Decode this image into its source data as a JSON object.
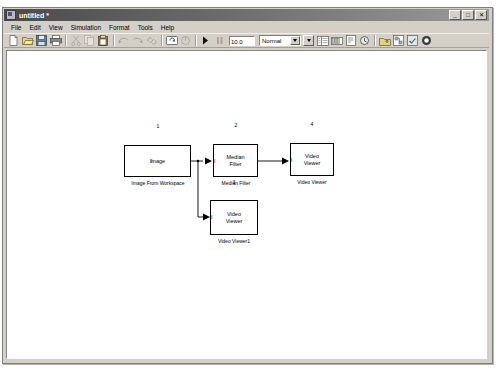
{
  "window": {
    "title": "untitled *",
    "icon": "simulink-model-icon",
    "buttons": [
      {
        "name": "minimize",
        "glyph": "_"
      },
      {
        "name": "maximize",
        "glyph": "□"
      },
      {
        "name": "close",
        "glyph": "✕"
      }
    ]
  },
  "menubar": {
    "items": [
      {
        "label": "File"
      },
      {
        "label": "Edit"
      },
      {
        "label": "View"
      },
      {
        "label": "Simulation"
      },
      {
        "label": "Format"
      },
      {
        "label": "Tools"
      },
      {
        "label": "Help"
      }
    ]
  },
  "toolbar": {
    "stop_time": "10.0",
    "sim_mode": "Normal",
    "buttons": [
      {
        "name": "new-model-icon"
      },
      {
        "name": "open-folder-icon"
      },
      {
        "name": "save-icon"
      },
      {
        "name": "print-icon"
      },
      {
        "name": "cut-icon"
      },
      {
        "name": "copy-icon"
      },
      {
        "name": "paste-icon"
      },
      {
        "name": "undo-icon"
      },
      {
        "name": "redo-icon"
      },
      {
        "name": "link-icon"
      },
      {
        "name": "update-diagram-icon"
      },
      {
        "name": "refresh-icon"
      },
      {
        "name": "start-simulation-icon"
      },
      {
        "name": "stop-simulation-icon"
      },
      {
        "name": "model-explorer-icon"
      },
      {
        "name": "library-browser-icon"
      },
      {
        "name": "toggle-model-browser-icon"
      },
      {
        "name": "debug-icon"
      },
      {
        "name": "go-to-parent-icon"
      },
      {
        "name": "build-model-icon"
      },
      {
        "name": "model-advisor-icon"
      },
      {
        "name": "block-help-icon"
      }
    ]
  },
  "canvas": {
    "blocks": [
      {
        "id": "image-from-workspace",
        "number": "1",
        "inner_text": "Image",
        "caption": "Image From Workspace",
        "port_label": "I",
        "x": 117,
        "y": 94,
        "w": 67,
        "h": 32
      },
      {
        "id": "median-filter",
        "number": "2",
        "inner_text": "Median\nFilter",
        "caption": "Median Filter",
        "port_label": "I",
        "x": 206,
        "y": 93,
        "w": 45,
        "h": 33
      },
      {
        "id": "video-viewer",
        "number": "4",
        "inner_text": "Video\nViewer",
        "caption": "Video Viewer",
        "port_label": "I",
        "x": 283,
        "y": 92,
        "w": 44,
        "h": 33
      },
      {
        "id": "video-viewer1",
        "number": "3",
        "inner_text": "Video\nViewer",
        "caption": "Video Viewer1",
        "port_label": "I",
        "x": 203,
        "y": 149,
        "w": 48,
        "h": 35
      }
    ]
  }
}
